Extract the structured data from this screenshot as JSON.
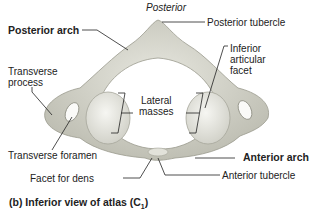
{
  "figure": {
    "caption_prefix": "(b) Inferior view of atlas (C",
    "caption_sub": "1",
    "caption_suffix": ")",
    "orientation_label": "Posterior"
  },
  "labels": {
    "posterior_arch": "Posterior arch",
    "posterior_tubercle": "Posterior tubercle",
    "transverse_process_1": "Transverse",
    "transverse_process_2": "process",
    "inferior_articular_facet_1": "Inferior",
    "inferior_articular_facet_2": "articular",
    "inferior_articular_facet_3": "facet",
    "lateral_masses_1": "Lateral",
    "lateral_masses_2": "masses",
    "transverse_foramen": "Transverse foramen",
    "anterior_arch": "Anterior arch",
    "facet_for_dens": "Facet for dens",
    "anterior_tubercle": "Anterior tubercle"
  },
  "colors": {
    "bone": "#d9d9cf",
    "bone_shadow": "#b9b9ad",
    "facet": "#ececE6",
    "text": "#222222"
  }
}
